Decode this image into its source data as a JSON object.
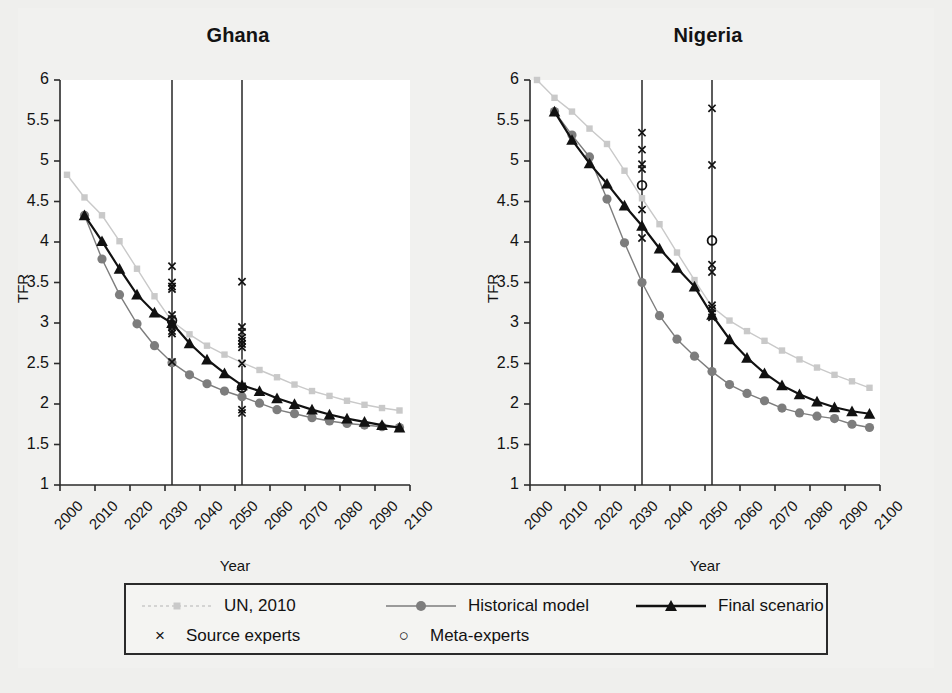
{
  "figure": {
    "background": "#efefed",
    "panel_background": "#ffffff"
  },
  "colors": {
    "un_2010": "#c9c9c9",
    "historical_model": "#7d7d7d",
    "final_scenario": "#111111",
    "axis": "#2b2b2b",
    "vline": "#262626"
  },
  "panels": [
    {
      "title": "Ghana",
      "xlabel": "Year",
      "ylabel": "TFR"
    },
    {
      "title": "Nigeria",
      "xlabel": "Year",
      "ylabel": "TFR"
    }
  ],
  "axis": {
    "y_ticks": [
      "1",
      "1.5",
      "2",
      "2.5",
      "3",
      "3.5",
      "4",
      "4.5",
      "5",
      "5.5",
      "6"
    ],
    "x_ticks": [
      "2000",
      "2010",
      "2020",
      "2030",
      "2040",
      "2050",
      "2060",
      "2070",
      "2080",
      "2090",
      "2100"
    ]
  },
  "legend": {
    "rows": [
      [
        {
          "key": "line-square-marker",
          "label": "UN, 2010"
        },
        {
          "key": "line-circle-marker",
          "label": "Historical model"
        },
        {
          "key": "line-triangle-marker",
          "label": "Final scenario"
        }
      ],
      [
        {
          "key": "x-marker",
          "label": "Source experts"
        },
        {
          "key": "o-marker",
          "label": "Meta-experts"
        }
      ]
    ]
  },
  "chart_data": {
    "type": "line",
    "xlabel": "Year",
    "ylabel": "TFR",
    "xlim": [
      2000,
      2100
    ],
    "ylim": [
      1,
      6
    ],
    "y_ticks": [
      1,
      1.5,
      2,
      2.5,
      3,
      3.5,
      4,
      4.5,
      5,
      5.5,
      6
    ],
    "x_ticks": [
      2000,
      2010,
      2020,
      2030,
      2040,
      2050,
      2060,
      2070,
      2080,
      2090,
      2100
    ],
    "grid": false,
    "legend_position": "bottom",
    "reference_lines": {
      "x": [
        2032,
        2052
      ],
      "style": "solid-vertical"
    },
    "panels": [
      {
        "name": "Ghana",
        "series": [
          {
            "name": "UN, 2010",
            "marker": "square",
            "color": "#c9c9c9",
            "x": [
              2002,
              2007,
              2012,
              2017,
              2022,
              2027,
              2032,
              2037,
              2042,
              2047,
              2052,
              2057,
              2062,
              2067,
              2072,
              2077,
              2082,
              2087,
              2092,
              2097
            ],
            "y": [
              4.83,
              4.55,
              4.33,
              4.01,
              3.67,
              3.33,
              3.02,
              2.86,
              2.72,
              2.61,
              2.51,
              2.42,
              2.33,
              2.24,
              2.16,
              2.1,
              2.04,
              1.99,
              1.95,
              1.92
            ]
          },
          {
            "name": "Historical model",
            "marker": "circle",
            "color": "#7d7d7d",
            "x": [
              2007,
              2012,
              2017,
              2022,
              2027,
              2032,
              2037,
              2042,
              2047,
              2052,
              2057,
              2062,
              2067,
              2072,
              2077,
              2082,
              2087,
              2092,
              2097
            ],
            "y": [
              4.33,
              3.79,
              3.35,
              2.99,
              2.72,
              2.51,
              2.36,
              2.25,
              2.16,
              2.09,
              2.01,
              1.93,
              1.88,
              1.83,
              1.79,
              1.76,
              1.74,
              1.72,
              1.71
            ]
          },
          {
            "name": "Final scenario",
            "marker": "triangle",
            "color": "#111111",
            "x": [
              2007,
              2012,
              2017,
              2022,
              2027,
              2032,
              2037,
              2042,
              2047,
              2052,
              2057,
              2062,
              2067,
              2072,
              2077,
              2082,
              2087,
              2092,
              2097
            ],
            "y": [
              4.33,
              4.01,
              3.67,
              3.35,
              3.13,
              3.0,
              2.75,
              2.55,
              2.38,
              2.23,
              2.16,
              2.07,
              2.0,
              1.93,
              1.87,
              1.82,
              1.78,
              1.74,
              1.71
            ]
          }
        ],
        "source_experts": {
          "marker": "x",
          "points": [
            {
              "year": 2032,
              "values": [
                3.7,
                3.5,
                3.45,
                3.42,
                3.1,
                3.05,
                2.95,
                2.9,
                2.87,
                2.52
              ]
            },
            {
              "year": 2052,
              "values": [
                3.51,
                2.95,
                2.89,
                2.82,
                2.78,
                2.74,
                2.7,
                2.5,
                2.22,
                1.93,
                1.89
              ]
            }
          ]
        },
        "meta_experts": {
          "marker": "o",
          "points": [
            {
              "year": 2032,
              "value": 3.03
            },
            {
              "year": 2052,
              "value": 2.2
            }
          ]
        }
      },
      {
        "name": "Nigeria",
        "series": [
          {
            "name": "UN, 2010",
            "marker": "square",
            "color": "#c9c9c9",
            "x": [
              2002,
              2007,
              2012,
              2017,
              2022,
              2027,
              2032,
              2037,
              2042,
              2047,
              2052,
              2057,
              2062,
              2067,
              2072,
              2077,
              2082,
              2087,
              2092,
              2097
            ],
            "y": [
              6.0,
              5.78,
              5.61,
              5.4,
              5.21,
              4.88,
              4.54,
              4.22,
              3.87,
              3.53,
              3.2,
              3.03,
              2.9,
              2.78,
              2.66,
              2.55,
              2.45,
              2.36,
              2.28,
              2.2
            ]
          },
          {
            "name": "Historical model",
            "marker": "circle",
            "color": "#7d7d7d",
            "x": [
              2007,
              2012,
              2017,
              2022,
              2027,
              2032,
              2037,
              2042,
              2047,
              2052,
              2057,
              2062,
              2067,
              2072,
              2077,
              2082,
              2087,
              2092,
              2097
            ],
            "y": [
              5.61,
              5.32,
              5.05,
              4.53,
              3.99,
              3.5,
              3.09,
              2.8,
              2.59,
              2.4,
              2.24,
              2.13,
              2.04,
              1.95,
              1.89,
              1.85,
              1.82,
              1.75,
              1.71
            ]
          },
          {
            "name": "Final scenario",
            "marker": "triangle",
            "color": "#111111",
            "x": [
              2007,
              2012,
              2017,
              2022,
              2027,
              2032,
              2037,
              2042,
              2047,
              2052,
              2057,
              2062,
              2067,
              2072,
              2077,
              2082,
              2087,
              2092,
              2097
            ],
            "y": [
              5.61,
              5.26,
              4.97,
              4.72,
              4.45,
              4.2,
              3.92,
              3.68,
              3.45,
              3.1,
              2.8,
              2.57,
              2.38,
              2.23,
              2.12,
              2.03,
              1.96,
              1.91,
              1.88
            ]
          }
        ],
        "source_experts": {
          "marker": "x",
          "points": [
            {
              "year": 2032,
              "values": [
                5.35,
                5.14,
                4.96,
                4.9,
                4.4,
                4.05
              ]
            },
            {
              "year": 2052,
              "values": [
                5.65,
                4.95,
                3.72,
                3.63,
                3.22,
                3.18,
                3.12,
                3.07
              ]
            }
          ]
        },
        "meta_experts": {
          "marker": "o",
          "points": [
            {
              "year": 2032,
              "value": 4.7
            },
            {
              "year": 2052,
              "value": 4.02
            }
          ]
        }
      }
    ]
  }
}
